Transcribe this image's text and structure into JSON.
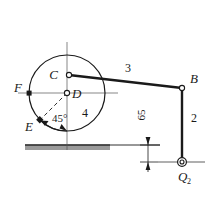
{
  "figure": {
    "background_color": "#ffffff",
    "line_color": "#1a1a1a",
    "ground_hatch_color": "#8a8a8a"
  },
  "labels": {
    "point_C": "C",
    "point_D": "D",
    "point_E": "E",
    "point_F": "F",
    "point_B": "B",
    "link_2": "2",
    "link_3": "3",
    "link_4": "4",
    "angle_45": "45°",
    "dimension_65": "65",
    "load_Q2": "Q",
    "load_Q2_sub": "2"
  },
  "geometry": {
    "disc_center": {
      "x": 67,
      "y": 93
    },
    "disc_radius": 38,
    "point_C": {
      "x": 69,
      "y": 75
    },
    "point_D": {
      "x": 67,
      "y": 93
    },
    "point_E": {
      "x": 40,
      "y": 120
    },
    "point_F": {
      "x": 29,
      "y": 93
    },
    "point_B": {
      "x": 182,
      "y": 88
    },
    "point_Q": {
      "x": 182,
      "y": 162
    },
    "ground_line_y": 145,
    "dimension_value": 65,
    "angle_value": 45
  }
}
